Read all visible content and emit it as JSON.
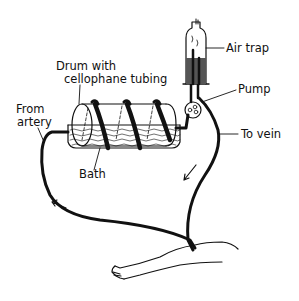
{
  "diagram": {
    "labels": {
      "air_trap": "Air trap",
      "drum_line1": "Drum with",
      "drum_line2": "cellophane tubing",
      "pump": "Pump",
      "from_artery_line1": "From",
      "from_artery_line2": "artery",
      "to_vein": "To vein",
      "bath": "Bath"
    },
    "colors": {
      "ink": "#111111",
      "background": "#ffffff"
    }
  }
}
